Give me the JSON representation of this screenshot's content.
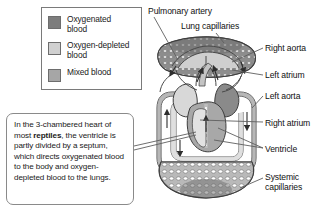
{
  "figure": {
    "background": "#ffffff"
  },
  "legend": {
    "items": [
      {
        "label": "Oxygenated\nblood",
        "color": "#7d7d7d",
        "swatch_name": "oxygenated-blood-swatch"
      },
      {
        "label": "Oxygen-depleted\nblood",
        "color": "#d0d0d0",
        "swatch_name": "oxygen-depleted-blood-swatch"
      },
      {
        "label": "Mixed blood",
        "color": "#a6a6a6",
        "swatch_name": "mixed-blood-swatch"
      }
    ]
  },
  "callout": {
    "text_before": "In the  3-chambered heart of most ",
    "emphasis": "reptiles",
    "text_after": ", the ventricle is partly divided by a septum, which directs oxygenated blood to the body and oxygen-depleted blood to the lungs."
  },
  "annotations": {
    "pulmonary_artery": "Pulmonary artery",
    "lung_capillaries": "Lung capillaries",
    "right_aorta": "Right aorta",
    "left_atrium": "Left atrium",
    "left_aorta": "Left aorta",
    "right_atrium": "Right atrium",
    "ventricle": "Ventricle",
    "systemic_capillaries": "Systemic\ncapillaries"
  },
  "diagram_data": {
    "type": "anatomical-schematic",
    "subject": "Reptilian circulatory system",
    "chamber_count": 3,
    "blood_types": [
      "Oxygenated blood",
      "Oxygen-depleted blood",
      "Mixed blood"
    ],
    "structures": [
      {
        "name": "Lung capillaries",
        "blood": "transition",
        "position": "top",
        "render": "stippled-mesh"
      },
      {
        "name": "Pulmonary artery",
        "blood": "Oxygen-depleted blood",
        "position": "upper-left-vessel"
      },
      {
        "name": "Right aorta",
        "blood": "Oxygenated blood",
        "position": "upper-right"
      },
      {
        "name": "Left aorta",
        "blood": "Mixed blood",
        "position": "right"
      },
      {
        "name": "Left atrium",
        "blood": "Oxygenated blood",
        "position": "heart-right"
      },
      {
        "name": "Right atrium",
        "blood": "Oxygen-depleted blood",
        "position": "heart-left"
      },
      {
        "name": "Ventricle",
        "blood": "Mixed blood",
        "position": "heart-center-lower"
      },
      {
        "name": "Systemic capillaries",
        "blood": "transition",
        "position": "bottom",
        "render": "stippled-mesh"
      }
    ],
    "flow_arrows": 8,
    "colors": {
      "oxygenated": "#7d7d7d",
      "depleted": "#d0d0d0",
      "mixed": "#a6a6a6",
      "outline": "#4a4a4a",
      "leader_line": "#6b6b6b"
    }
  }
}
